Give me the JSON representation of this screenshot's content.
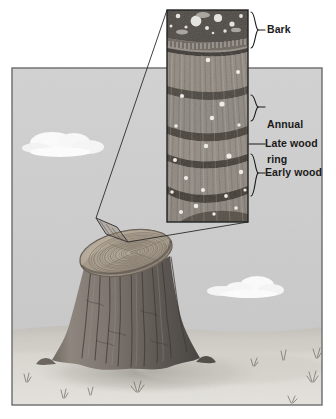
{
  "figure": {
    "frame": {
      "x": 12,
      "y": 68,
      "width": 310,
      "height": 337,
      "border_color": "#6b6b6b",
      "sky_color": "#cfcfcf",
      "ground_color": "#d7d4cf"
    },
    "inset": {
      "name": "magnified-wood-section",
      "x": 167,
      "y": 10,
      "width": 81,
      "height": 212,
      "border_color": "#2b2b2b",
      "bark_band_color": "#4a4a4a",
      "late_wood_color": "#4f4a44",
      "early_wood_color": "#8e877e"
    },
    "callout": {
      "source_x": 96,
      "source_y": 218,
      "line_color": "#2b2b2b"
    },
    "labels": [
      {
        "id": "bark",
        "text": "Bark",
        "marker": "brace",
        "text_x": 268,
        "text_y": 22,
        "brace_top": 12,
        "brace_bottom": 48,
        "brace_x": 252
      },
      {
        "id": "annual-ring",
        "text": "Annual\nring",
        "line1": "Annual",
        "line2": "ring",
        "marker": "brace",
        "text_x": 268,
        "text_y": 97,
        "brace_top": 95,
        "brace_bottom": 121,
        "brace_x": 252
      },
      {
        "id": "late-wood",
        "text": "Late wood",
        "marker": "leader-line",
        "text_x": 266,
        "text_y": 139,
        "leader_x1": 250,
        "leader_x2": 266,
        "leader_y": 144
      },
      {
        "id": "early-wood",
        "text": "Early wood",
        "marker": "brace",
        "text_x": 268,
        "text_y": 166,
        "brace_top": 154,
        "brace_bottom": 196,
        "brace_x": 252
      }
    ],
    "stump": {
      "name": "tree-stump",
      "top_center_x": 126,
      "top_center_y": 253,
      "top_rx": 47,
      "top_ry": 22,
      "trunk_color_light": "#9a938c",
      "trunk_color_dark": "#4e4945",
      "cut_face_color": "#b4aa9c",
      "ring_color": "#7a7068",
      "sample_patch": {
        "label": "callout-source-patch",
        "points": "96,218 117,227 128,242 106,234"
      }
    },
    "clouds": [
      {
        "id": "cloud-left",
        "cx": 60,
        "cy": 142,
        "scale": 1.0
      },
      {
        "id": "cloud-right",
        "cx": 253,
        "cy": 288,
        "scale": 0.82
      }
    ],
    "grass_tufts": [
      {
        "x": 26,
        "y": 382
      },
      {
        "x": 63,
        "y": 398
      },
      {
        "x": 90,
        "y": 395
      },
      {
        "x": 137,
        "y": 392
      },
      {
        "x": 253,
        "y": 366
      },
      {
        "x": 283,
        "y": 360
      },
      {
        "x": 316,
        "y": 358
      },
      {
        "x": 312,
        "y": 382
      },
      {
        "x": 291,
        "y": 403
      }
    ]
  }
}
